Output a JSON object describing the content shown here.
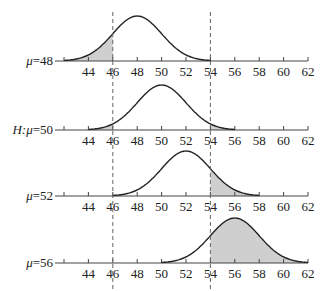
{
  "figure": {
    "x_ticks": [
      42,
      44,
      46,
      48,
      50,
      52,
      54,
      56,
      58,
      60,
      62
    ],
    "x_tick_labels": [
      "44",
      "46",
      "48",
      "50",
      "52",
      "54",
      "56",
      "58",
      "60",
      "62"
    ],
    "critical_lines": [
      46,
      54
    ],
    "colors": {
      "curve": "#222222",
      "axis": "#444444",
      "shade": "#cfcfcf",
      "dash": "#666666"
    },
    "panels": [
      {
        "label_prefix": "",
        "label_mu": "μ",
        "label_eq": "=48",
        "label": "μ=48",
        "mu": 48,
        "shade": [
          [
            42,
            46
          ]
        ],
        "range": [
          42,
          54
        ]
      },
      {
        "label_prefix": "H:",
        "label_mu": "μ",
        "label_eq": "=50",
        "label": "H:μ=50",
        "mu": 50,
        "shade": [
          [
            44,
            46
          ],
          [
            54,
            56
          ]
        ],
        "range": [
          44,
          56
        ]
      },
      {
        "label_prefix": "",
        "label_mu": "μ",
        "label_eq": "=52",
        "label": "μ=52",
        "mu": 52,
        "shade": [
          [
            54,
            58
          ]
        ],
        "range": [
          46,
          58
        ]
      },
      {
        "label_prefix": "",
        "label_mu": "μ",
        "label_eq": "=56",
        "label": "μ=56",
        "mu": 56,
        "shade": [
          [
            54,
            62
          ]
        ],
        "range": [
          50,
          62
        ]
      }
    ]
  },
  "chart_data": {
    "type": "line",
    "title": "",
    "xlabel": "",
    "ylabel": "",
    "xlim": [
      42,
      62
    ],
    "critical_region_bounds": [
      46,
      54
    ],
    "series": [
      {
        "name": "μ=48",
        "mean": 48,
        "support": [
          42,
          54
        ],
        "shaded_interval": [
          [
            42,
            46
          ]
        ]
      },
      {
        "name": "H:μ=50",
        "mean": 50,
        "support": [
          44,
          56
        ],
        "shaded_interval": [
          [
            44,
            46
          ],
          [
            54,
            56
          ]
        ]
      },
      {
        "name": "μ=52",
        "mean": 52,
        "support": [
          46,
          58
        ],
        "shaded_interval": [
          [
            54,
            58
          ]
        ]
      },
      {
        "name": "μ=56",
        "mean": 56,
        "support": [
          50,
          62
        ],
        "shaded_interval": [
          [
            54,
            62
          ]
        ]
      }
    ],
    "tick_labels": [
      "44",
      "46",
      "48",
      "50",
      "52",
      "54",
      "56",
      "58",
      "60",
      "62"
    ],
    "grid": false
  }
}
